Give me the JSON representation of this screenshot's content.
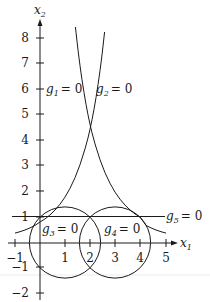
{
  "diagram": {
    "type": "feasible-region-plot",
    "axes": {
      "x_label": "x",
      "x_label_sub": "1",
      "y_label": "x",
      "y_label_sub": "2",
      "x_ticks": [
        "−1",
        "1",
        "2",
        "3",
        "4",
        "5"
      ],
      "y_ticks": [
        "8",
        "7",
        "6",
        "5",
        "4",
        "3",
        "2",
        "1",
        "−1",
        "−2"
      ],
      "x_range": [
        -1,
        5
      ],
      "y_range": [
        -2,
        8
      ]
    },
    "constraints": [
      {
        "id": "g1",
        "name": "g",
        "sub": "1",
        "rhs": "= 0",
        "shape": "curve x2 = e^x1"
      },
      {
        "id": "g2",
        "name": "g",
        "sub": "2",
        "rhs": "= 0",
        "shape": "curve x2 = e^(4 − x1)"
      },
      {
        "id": "g3",
        "name": "g",
        "sub": "3",
        "rhs": "= 0",
        "shape": "circle center (1,0), radius √2"
      },
      {
        "id": "g4",
        "name": "g",
        "sub": "4",
        "rhs": "= 0",
        "shape": "circle center (3,0), radius √2"
      },
      {
        "id": "g5",
        "name": "g",
        "sub": "5",
        "rhs": "= 0",
        "shape": "line x2 = 1"
      }
    ],
    "colors": {
      "stroke": "#1a1a1a",
      "background": "#ffffff",
      "artifact_line": "#e6e6e6"
    }
  }
}
